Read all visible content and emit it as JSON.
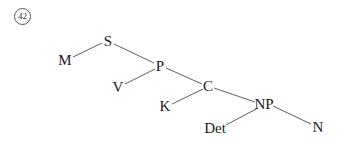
{
  "example_number": "42",
  "tree": {
    "nodes": [
      {
        "id": "S",
        "label": "S",
        "x": 108,
        "y": 41
      },
      {
        "id": "M",
        "label": "M",
        "x": 65,
        "y": 60
      },
      {
        "id": "P",
        "label": "P",
        "x": 160,
        "y": 66
      },
      {
        "id": "V",
        "label": "V",
        "x": 118,
        "y": 87
      },
      {
        "id": "C",
        "label": "C",
        "x": 208,
        "y": 86
      },
      {
        "id": "K",
        "label": "K",
        "x": 165,
        "y": 106
      },
      {
        "id": "NP",
        "label": "NP",
        "x": 264,
        "y": 104
      },
      {
        "id": "Det",
        "label": "Det",
        "x": 215,
        "y": 128
      },
      {
        "id": "N",
        "label": "N",
        "x": 318,
        "y": 127
      }
    ],
    "edges": [
      [
        "S",
        "M"
      ],
      [
        "S",
        "P"
      ],
      [
        "P",
        "V"
      ],
      [
        "P",
        "C"
      ],
      [
        "C",
        "K"
      ],
      [
        "C",
        "NP"
      ],
      [
        "NP",
        "Det"
      ],
      [
        "NP",
        "N"
      ]
    ]
  }
}
